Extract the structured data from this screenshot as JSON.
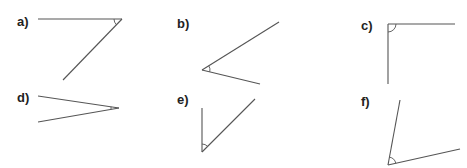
{
  "diagram": {
    "type": "angle-diagrams",
    "stroke_color": "#555555",
    "angles": [
      {
        "label": "a)",
        "label_pos": [
          17,
          14
        ],
        "vertex": [
          122,
          19
        ],
        "ray1": [
          38,
          19
        ],
        "ray2": [
          63,
          80
        ],
        "kind": "acute"
      },
      {
        "label": "b)",
        "label_pos": [
          177,
          16
        ],
        "vertex": [
          202,
          70
        ],
        "ray1": [
          279,
          22
        ],
        "ray2": [
          260,
          84
        ],
        "kind": "acute"
      },
      {
        "label": "c)",
        "label_pos": [
          361,
          18
        ],
        "vertex": [
          388,
          24
        ],
        "ray1": [
          455,
          24
        ],
        "ray2": [
          388,
          84
        ],
        "kind": "right"
      },
      {
        "label": "d)",
        "label_pos": [
          17,
          90
        ],
        "vertex": [
          119,
          108
        ],
        "ray1": [
          38,
          96
        ],
        "ray2": [
          38,
          122
        ],
        "kind": "acute"
      },
      {
        "label": "e)",
        "label_pos": [
          177,
          92
        ],
        "vertex": [
          202,
          152
        ],
        "ray1": [
          202,
          108
        ],
        "ray2": [
          255,
          99
        ],
        "kind": "acute"
      },
      {
        "label": "f)",
        "label_pos": [
          361,
          94
        ],
        "vertex": [
          388,
          165
        ],
        "ray1": [
          400,
          100
        ],
        "ray2": [
          460,
          149
        ],
        "kind": "acute"
      }
    ]
  }
}
